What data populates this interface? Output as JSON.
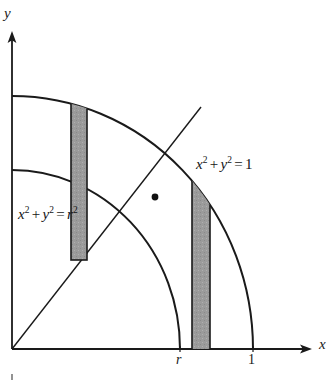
{
  "figure": {
    "axes": {
      "x_axis_label": "x",
      "y_axis_label": "y",
      "origin_label": ""
    },
    "ticks": {
      "x": [
        {
          "label": "r",
          "value": "r"
        },
        {
          "label": "1",
          "value": "1"
        }
      ]
    },
    "curves": [
      {
        "name": "outer-circle",
        "equation_text": "x2 + y2 = 1",
        "label_parts": {
          "var1": "x",
          "exp1": "2",
          "plus": "+",
          "var2": "y",
          "exp2": "2",
          "equals": "=",
          "rhs": "1",
          "rhs_exp": ""
        },
        "radius_label": "1"
      },
      {
        "name": "inner-circle",
        "equation_text": "x2 + y2 = r2",
        "label_parts": {
          "var1": "x",
          "exp1": "2",
          "plus": "+",
          "var2": "y",
          "exp2": "2",
          "equals": "=",
          "rhs": "r",
          "rhs_exp": "2"
        },
        "radius_label": "r"
      }
    ],
    "diagonal_line": {
      "name": "line-y-equals-x",
      "label": ""
    },
    "marked_point": {
      "name": "point-on-diagonal",
      "label": ""
    },
    "strips": [
      {
        "name": "shaded-strip-left",
        "label": ""
      },
      {
        "name": "shaded-strip-right",
        "label": ""
      }
    ],
    "colors": {
      "stroke": "#1a1a1a",
      "strip_fill": "#9a9a9a",
      "strip_stroke": "#1a1a1a",
      "background": "#ffffff"
    }
  }
}
